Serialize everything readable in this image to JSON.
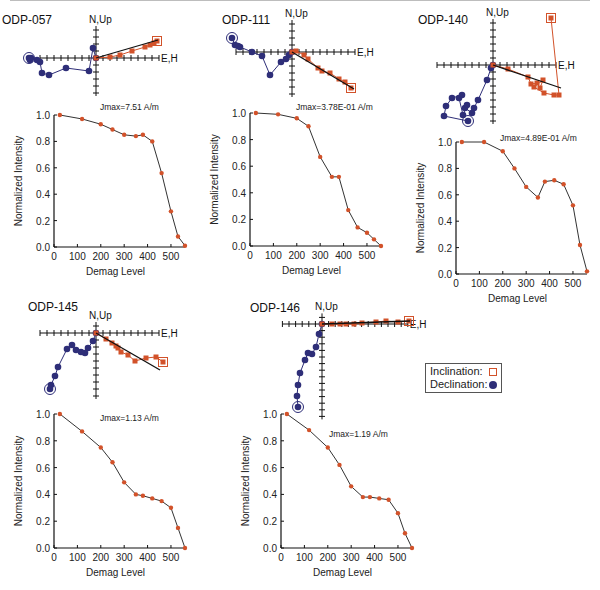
{
  "figure": {
    "legend": {
      "inclination_label": "Inclination:",
      "declination_label": "Declination:",
      "inclination_symbol": "open-square",
      "declination_symbol": "filled-circle"
    },
    "colors": {
      "inclination": "#d2522a",
      "declination": "#2e2e78",
      "line": "#333333",
      "fit_line": "#111111"
    },
    "zijderveld_axis_labels": {
      "vertical": "N,Up",
      "horizontal": "E,H"
    }
  },
  "chart_data": [
    {
      "type": "line",
      "title": "ODP-057",
      "annotation": "Jmax=7.51 A/m",
      "xlabel": "Demag Level",
      "ylabel": "Normalized Intensity",
      "xlim": [
        0,
        560
      ],
      "ylim": [
        0,
        1.0
      ],
      "xticks": [
        0,
        100,
        200,
        300,
        400,
        500
      ],
      "yticks": [
        "0.0",
        "0.2",
        "0.4",
        "0.6",
        "0.8",
        "1.0"
      ],
      "x": [
        25,
        120,
        200,
        250,
        300,
        350,
        380,
        420,
        460,
        500,
        530,
        560
      ],
      "values": [
        1.0,
        0.97,
        0.93,
        0.89,
        0.85,
        0.84,
        0.85,
        0.8,
        0.56,
        0.27,
        0.08,
        0.01
      ]
    },
    {
      "type": "line",
      "title": "ODP-111",
      "annotation": "Jmax=3.78E-01 A/m",
      "xlabel": "Demag Level",
      "ylabel": "Normalized Intensity",
      "xlim": [
        0,
        560
      ],
      "ylim": [
        0,
        1.0
      ],
      "xticks": [
        0,
        100,
        200,
        300,
        400,
        500
      ],
      "yticks": [
        "0.0",
        "0.2",
        "0.4",
        "0.6",
        "0.8",
        "1.0"
      ],
      "x": [
        25,
        120,
        200,
        250,
        300,
        350,
        380,
        420,
        460,
        500,
        530,
        560
      ],
      "values": [
        1.0,
        0.99,
        0.96,
        0.9,
        0.67,
        0.52,
        0.52,
        0.27,
        0.14,
        0.1,
        0.05,
        0.0
      ]
    },
    {
      "type": "line",
      "title": "ODP-140",
      "annotation": "Jmax=4.89E-01 A/m",
      "xlabel": "Demag Level",
      "ylabel": "Normalized Intensity",
      "xlim": [
        0,
        560
      ],
      "ylim": [
        0,
        1.0
      ],
      "xticks": [
        0,
        100,
        200,
        300,
        400,
        500
      ],
      "yticks": [
        "0.0",
        "0.2",
        "0.4",
        "0.6",
        "0.8",
        "1.0"
      ],
      "x": [
        25,
        120,
        200,
        250,
        300,
        350,
        380,
        420,
        460,
        500,
        530,
        560
      ],
      "values": [
        1.0,
        1.0,
        0.93,
        0.8,
        0.66,
        0.58,
        0.7,
        0.71,
        0.68,
        0.52,
        0.22,
        0.02
      ]
    },
    {
      "type": "line",
      "title": "ODP-145",
      "annotation": "Jmax=1.13 A/m",
      "xlabel": "Demag Level",
      "ylabel": "Normalized Intensity",
      "xlim": [
        0,
        560
      ],
      "ylim": [
        0,
        1.0
      ],
      "xticks": [
        0,
        100,
        200,
        300,
        400,
        500
      ],
      "yticks": [
        "0.0",
        "0.2",
        "0.4",
        "0.6",
        "0.8",
        "1.0"
      ],
      "x": [
        25,
        120,
        200,
        250,
        300,
        350,
        380,
        420,
        460,
        500,
        530,
        560
      ],
      "values": [
        1.0,
        0.87,
        0.75,
        0.64,
        0.49,
        0.4,
        0.39,
        0.37,
        0.35,
        0.3,
        0.15,
        0.0
      ]
    },
    {
      "type": "line",
      "title": "ODP-146",
      "annotation": "Jmax=1.19 A/m",
      "xlabel": "Demag Level",
      "ylabel": "Normalized Intensity",
      "xlim": [
        0,
        560
      ],
      "ylim": [
        0,
        1.0
      ],
      "xticks": [
        0,
        100,
        200,
        300,
        400,
        500
      ],
      "yticks": [
        "0.0",
        "0.2",
        "0.4",
        "0.6",
        "0.8",
        "1.0"
      ],
      "x": [
        25,
        120,
        200,
        250,
        300,
        350,
        380,
        420,
        460,
        500,
        530,
        560
      ],
      "values": [
        1.0,
        0.88,
        0.75,
        0.62,
        0.46,
        0.38,
        0.38,
        0.37,
        0.36,
        0.26,
        0.11,
        0.0
      ]
    }
  ],
  "layout": {
    "panels": [
      {
        "title_pos": [
          2,
          24
        ],
        "zij": {
          "ox": 96,
          "oy": 58,
          "ticksL": 8,
          "ticksR": 9,
          "ticksU": 4,
          "ticksD": 5,
          "step": 7,
          "inc": [
            [
              96,
              58
            ],
            [
              110,
              57
            ],
            [
              120,
              55
            ],
            [
              132,
              51
            ],
            [
              145,
              47
            ],
            [
              150,
              45
            ],
            [
              154,
              43
            ],
            [
              157,
              41
            ]
          ],
          "dec": [
            [
              96,
              58
            ],
            [
              93,
              48
            ],
            [
              89,
              71
            ],
            [
              66,
              68
            ],
            [
              49,
              75
            ],
            [
              42,
              73
            ],
            [
              40,
              62
            ],
            [
              37,
              60
            ],
            [
              31,
              58
            ],
            [
              30,
              60
            ],
            [
              29,
              58
            ]
          ],
          "fit": [
            [
              96,
              58
            ],
            [
              158,
              40
            ]
          ]
        },
        "plot": {
          "x0": 54,
          "y0": 247,
          "x1": 185,
          "y1": 115
        },
        "ann_pos": [
          100,
          110
        ]
      },
      {
        "title_pos": [
          222,
          24
        ],
        "zij": {
          "ox": 292,
          "oy": 52,
          "ticksL": 8,
          "ticksR": 9,
          "ticksU": 4,
          "ticksD": 6,
          "step": 7,
          "inc": [
            [
              292,
              52
            ],
            [
              296,
              51
            ],
            [
              304,
              55
            ],
            [
              308,
              59
            ],
            [
              318,
              68
            ],
            [
              322,
              71
            ],
            [
              330,
              73
            ],
            [
              339,
              79
            ],
            [
              345,
              82
            ],
            [
              351,
              88
            ]
          ],
          "dec": [
            [
              292,
              52
            ],
            [
              289,
              55
            ],
            [
              286,
              59
            ],
            [
              281,
              62
            ],
            [
              270,
              75
            ],
            [
              262,
              56
            ],
            [
              252,
              52
            ],
            [
              240,
              47
            ],
            [
              238,
              46
            ],
            [
              235,
              45
            ],
            [
              232,
              38
            ]
          ],
          "fit": [
            [
              292,
              52
            ],
            [
              354,
              89
            ]
          ]
        },
        "plot": {
          "x0": 250,
          "y0": 246,
          "x1": 381,
          "y1": 113
        },
        "ann_pos": [
          296,
          110
        ]
      },
      {
        "title_pos": [
          418,
          24
        ],
        "zij": {
          "ox": 493,
          "oy": 65,
          "ticksL": 8,
          "ticksR": 9,
          "ticksU": 6,
          "ticksD": 8,
          "step": 7,
          "inc": [
            [
              493,
              65
            ],
            [
              508,
              69
            ],
            [
              528,
              77
            ],
            [
              531,
              84
            ],
            [
              537,
              83
            ],
            [
              540,
              88
            ],
            [
              543,
              80
            ],
            [
              534,
              87
            ],
            [
              544,
              93
            ],
            [
              554,
              95
            ],
            [
              559,
              95
            ],
            [
              551,
              18
            ]
          ],
          "dec": [
            [
              493,
              65
            ],
            [
              491,
              68
            ],
            [
              487,
              80
            ],
            [
              478,
              100
            ],
            [
              474,
              108
            ],
            [
              472,
              113
            ],
            [
              465,
              108
            ],
            [
              467,
              105
            ],
            [
              463,
              115
            ],
            [
              459,
              98
            ],
            [
              462,
              95
            ],
            [
              452,
              98
            ],
            [
              446,
              106
            ],
            [
              444,
              116
            ],
            [
              468,
              121
            ]
          ],
          "fit": [
            [
              493,
              65
            ],
            [
              561,
              88
            ]
          ]
        },
        "plot": {
          "x0": 456,
          "y0": 274,
          "x1": 587,
          "y1": 142
        },
        "ann_pos": [
          500,
          141
        ]
      },
      {
        "title_pos": [
          28,
          311
        ],
        "zij": {
          "ox": 96,
          "oy": 333,
          "ticksL": 8,
          "ticksR": 9,
          "ticksU": 1,
          "ticksD": 9,
          "step": 7,
          "inc": [
            [
              96,
              333
            ],
            [
              106,
              339
            ],
            [
              112,
              343
            ],
            [
              116,
              346
            ],
            [
              118,
              348
            ],
            [
              121,
              352
            ],
            [
              128,
              355
            ],
            [
              135,
              361
            ],
            [
              146,
              358
            ],
            [
              156,
              357
            ],
            [
              163,
              362
            ]
          ],
          "dec": [
            [
              96,
              333
            ],
            [
              93,
              341
            ],
            [
              88,
              348
            ],
            [
              85,
              353
            ],
            [
              81,
              352
            ],
            [
              76,
              350
            ],
            [
              72,
              345
            ],
            [
              67,
              349
            ],
            [
              58,
              367
            ],
            [
              55,
              376
            ],
            [
              51,
              385
            ],
            [
              50,
              389
            ]
          ],
          "fit": [
            [
              96,
              333
            ],
            [
              160,
              370
            ]
          ]
        },
        "plot": {
          "x0": 54,
          "y0": 548,
          "x1": 185,
          "y1": 414
        },
        "ann_pos": [
          100,
          421
        ]
      },
      {
        "title_pos": [
          250,
          312
        ],
        "zij": {
          "ox": 322,
          "oy": 324,
          "ticksL": 6,
          "ticksR": 13,
          "ticksU": 1,
          "ticksD": 14,
          "step": 6.6,
          "inc": [
            [
              322,
              324
            ],
            [
              332,
              324
            ],
            [
              340,
              324
            ],
            [
              346,
              324
            ],
            [
              354,
              324
            ],
            [
              362,
              323
            ],
            [
              376,
              322
            ],
            [
              386,
              321
            ],
            [
              398,
              322
            ],
            [
              409,
              321
            ]
          ],
          "dec": [
            [
              322,
              324
            ],
            [
              319,
              334
            ],
            [
              316,
              347
            ],
            [
              312,
              354
            ],
            [
              308,
              353
            ],
            [
              305,
              360
            ],
            [
              300,
              373
            ],
            [
              298,
              385
            ],
            [
              297,
              396
            ],
            [
              298,
              407
            ]
          ],
          "fit": [
            [
              322,
              324
            ],
            [
              410,
              321
            ]
          ]
        },
        "plot": {
          "x0": 281,
          "y0": 548,
          "x1": 412,
          "y1": 414
        },
        "ann_pos": [
          329,
          437
        ]
      }
    ]
  }
}
